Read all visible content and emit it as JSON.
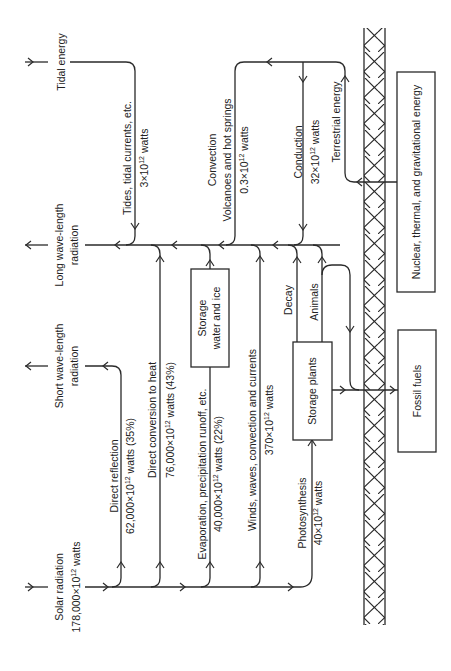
{
  "diagram": {
    "orientation": "rotated-90-ccw",
    "sources": {
      "solar": {
        "line1": "Solar radiation",
        "line2_pre": "178,000×10",
        "exp": "12",
        "line2_post": " watts"
      },
      "tidal": {
        "label": "Tidal energy"
      },
      "terrestrial": {
        "label": "Terrestrial energy"
      }
    },
    "sinks": {
      "short_wave": {
        "line1": "Short wave-length",
        "line2": "radiation"
      },
      "long_wave": {
        "line1": "Long wave-length",
        "line2": "radiation"
      }
    },
    "flows": {
      "direct_reflection": {
        "line1": "Direct reflection",
        "line2_pre": "62,000×10",
        "exp": "12",
        "line2_post": " watts (35%)"
      },
      "direct_conversion": {
        "line1": "Direct conversion to heat",
        "line2_pre": "76,000×10",
        "exp": "12",
        "line2_post": " watts (43%)"
      },
      "evaporation": {
        "line1": "Evaporation, precipitation runoff, etc.",
        "line2_pre": "40,000×10",
        "exp": "12",
        "line2_post": " watts (22%)"
      },
      "winds": {
        "line1": "Winds, waves, convection and currents",
        "line2_pre": "370×10",
        "exp": "12",
        "line2_post": " watts"
      },
      "photosynthesis": {
        "line1": "Photosynthesis",
        "line2_pre": "40×10",
        "exp": "12",
        "line2_post": " watts"
      },
      "tides": {
        "line1": "Tides, tidal currents, etc.",
        "line2_pre": "3×10",
        "exp": "12",
        "line2_post": " watts"
      },
      "convection": {
        "line1": "Convection",
        "line2": "Volcanoes and hot springs",
        "line3_pre": "0.3×10",
        "exp": "12",
        "line3_post": " watts"
      },
      "conduction": {
        "line1": "Conduction",
        "line2_pre": "32×10",
        "exp": "12",
        "line2_post": " watts"
      },
      "decay": {
        "label": "Decay"
      },
      "animals": {
        "label": "Animals"
      }
    },
    "boxes": {
      "storage_water": {
        "line1": "Storage",
        "line2": "water and ice"
      },
      "storage_plants": {
        "label": "Storage plants"
      },
      "fossil_fuels": {
        "label": "Fossil fuels"
      },
      "nuclear": {
        "label": "Nuclear, thermal, and gravitational energy"
      }
    },
    "colors": {
      "ink": "#2a2a2a",
      "paper": "#ffffff"
    }
  }
}
